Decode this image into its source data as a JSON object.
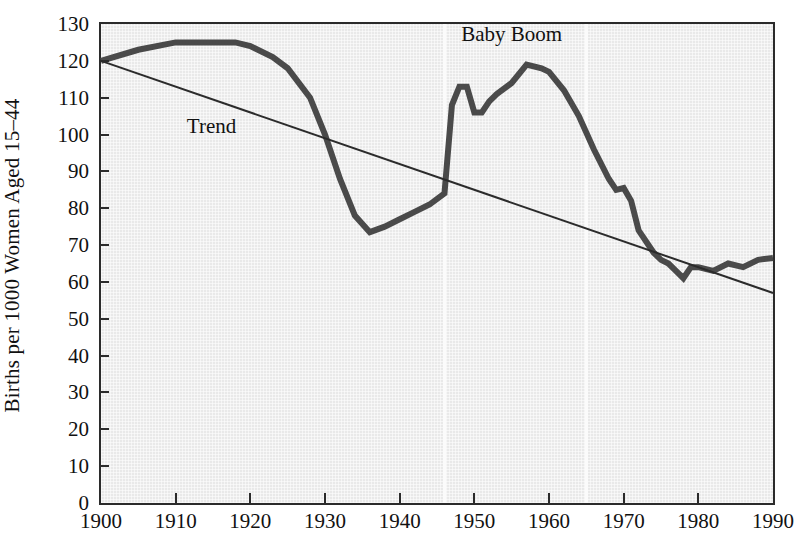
{
  "chart_data": {
    "type": "line",
    "title": "",
    "xlabel": "",
    "ylabel": "Births per 1000 Women Aged 15–44",
    "xlim": [
      1900,
      1990
    ],
    "ylim": [
      0,
      130
    ],
    "ytick_step": 10,
    "xtick_step": 10,
    "grid": false,
    "legend": "none",
    "ytick_labels": [
      "130",
      "120",
      "110",
      "100",
      "90",
      "80",
      "70",
      "60",
      "50",
      "40",
      "30",
      "20",
      "10",
      "0"
    ],
    "ytick_values": [
      130,
      120,
      110,
      100,
      90,
      80,
      70,
      60,
      50,
      40,
      30,
      20,
      10,
      0
    ],
    "xtick_labels": [
      "1900",
      "1910",
      "1920",
      "1930",
      "1940",
      "1950",
      "1960",
      "1970",
      "1980",
      "1990"
    ],
    "xtick_values": [
      1900,
      1910,
      1920,
      1930,
      1940,
      1950,
      1960,
      1970,
      1980,
      1990
    ],
    "annotations": [
      {
        "name": "trend-label",
        "text": "Trend",
        "x": 1911.5,
        "y": 102
      },
      {
        "name": "baby-boom-label",
        "text": "Baby Boom",
        "x": 1955,
        "y": 127
      }
    ],
    "shaded_region": {
      "name": "baby-boom-band",
      "start": 1946,
      "end": 1965
    },
    "series": [
      {
        "name": "Birth rate",
        "type": "line",
        "color": "#4a4a4a",
        "width": 6,
        "x": [
          1900,
          1905,
          1910,
          1912,
          1915,
          1918,
          1920,
          1923,
          1925,
          1928,
          1930,
          1932,
          1934,
          1936,
          1938,
          1940,
          1942,
          1944,
          1946,
          1947,
          1948,
          1949,
          1950,
          1951,
          1952,
          1953,
          1955,
          1957,
          1959,
          1960,
          1962,
          1964,
          1966,
          1968,
          1969,
          1970,
          1971,
          1972,
          1974,
          1975,
          1976,
          1977,
          1978,
          1979,
          1980,
          1982,
          1984,
          1986,
          1988,
          1990
        ],
        "y": [
          120,
          123,
          125,
          125,
          125,
          125,
          124,
          121,
          118,
          110,
          100,
          88,
          78,
          73.5,
          75,
          77,
          79,
          81,
          84,
          108,
          113,
          113,
          106,
          106,
          109,
          111,
          114,
          119,
          118,
          117,
          112,
          105,
          96,
          88,
          85,
          85.5,
          82,
          74,
          68,
          66,
          65,
          63,
          61,
          64,
          64,
          63,
          65,
          64,
          66,
          66.5
        ]
      },
      {
        "name": "Trend",
        "type": "line",
        "color": "#2b2b2b",
        "width": 2,
        "x": [
          1900,
          1990
        ],
        "y": [
          120,
          57
        ]
      }
    ]
  },
  "axes": {
    "y_title": "Births per 1000 Women Aged 15–44"
  }
}
